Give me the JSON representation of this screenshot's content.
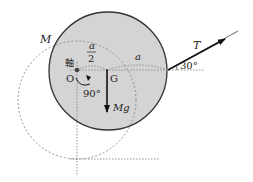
{
  "diagram": {
    "labels": {
      "mass": "M",
      "axis": "軸",
      "pivot": "O",
      "center": "G",
      "half_numer": "a",
      "half_denom": "2",
      "length": "a",
      "tension": "T",
      "angle_tension": "30°",
      "angle_rotation": "90°",
      "weight": "Mg"
    },
    "colors": {
      "disk_fill": "#d4d4d4",
      "disk_stroke": "#333333",
      "dashed": "#888888",
      "arrow": "#111111"
    }
  }
}
